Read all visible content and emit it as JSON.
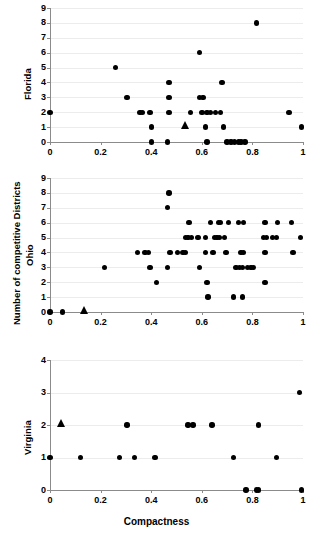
{
  "figure": {
    "background": "#ffffff",
    "marker_color": "#000000",
    "gridline_color": "#ececed",
    "axis_color": "#8b8b8b",
    "xlabel": "Compactness",
    "ylabel": "Number of competitive Districts"
  },
  "chart_data": {
    "type": "scatter",
    "title": "",
    "xlabel": "Compactness",
    "ylabel": "Number of competitive Districts",
    "xlim": [
      0,
      1
    ],
    "xticks": [
      0,
      0.2,
      0.4,
      0.6,
      0.8,
      1
    ],
    "xticklabels": [
      "0",
      "0.2",
      "0.4",
      "0.6",
      "0.8",
      "1"
    ],
    "grid": true,
    "legend": null,
    "panels": [
      {
        "name": "Florida",
        "label": "Florida",
        "ylim": [
          0,
          9
        ],
        "yticks": [
          0,
          1,
          2,
          3,
          4,
          5,
          6,
          7,
          8,
          9
        ],
        "yticklabels": [
          "0",
          "1",
          "2",
          "3",
          "4",
          "5",
          "6",
          "7",
          "8",
          "9"
        ],
        "series": [
          {
            "name": "districts",
            "marker": "circle",
            "points": [
              [
                0.0,
                2
              ],
              [
                0.26,
                5
              ],
              [
                0.305,
                3
              ],
              [
                0.355,
                2
              ],
              [
                0.365,
                2
              ],
              [
                0.395,
                2
              ],
              [
                0.4,
                1
              ],
              [
                0.4,
                0
              ],
              [
                0.465,
                0
              ],
              [
                0.47,
                4
              ],
              [
                0.47,
                3
              ],
              [
                0.47,
                2
              ],
              [
                0.555,
                2
              ],
              [
                0.59,
                6
              ],
              [
                0.59,
                3
              ],
              [
                0.605,
                3
              ],
              [
                0.6,
                2
              ],
              [
                0.615,
                1
              ],
              [
                0.62,
                2
              ],
              [
                0.635,
                2
              ],
              [
                0.62,
                0
              ],
              [
                0.655,
                2
              ],
              [
                0.675,
                2
              ],
              [
                0.68,
                4
              ],
              [
                0.685,
                1
              ],
              [
                0.7,
                0
              ],
              [
                0.715,
                0
              ],
              [
                0.73,
                0
              ],
              [
                0.745,
                0
              ],
              [
                0.755,
                0
              ],
              [
                0.77,
                0
              ],
              [
                0.815,
                8
              ],
              [
                0.945,
                2
              ],
              [
                0.995,
                1
              ]
            ]
          },
          {
            "name": "state-mean",
            "marker": "triangle",
            "points": [
              [
                0.535,
                1
              ]
            ]
          }
        ]
      },
      {
        "name": "Ohio",
        "label": "Ohio",
        "ylim": [
          0,
          9
        ],
        "yticks": [
          0,
          1,
          2,
          3,
          4,
          5,
          6,
          7,
          8,
          9
        ],
        "yticklabels": [
          "0",
          "1",
          "2",
          "3",
          "4",
          "5",
          "6",
          "7",
          "8",
          "9"
        ],
        "series": [
          {
            "name": "districts",
            "marker": "circle",
            "points": [
              [
                0.0,
                0
              ],
              [
                0.05,
                0
              ],
              [
                0.215,
                3
              ],
              [
                0.345,
                4
              ],
              [
                0.375,
                4
              ],
              [
                0.39,
                4
              ],
              [
                0.395,
                3
              ],
              [
                0.42,
                2
              ],
              [
                0.47,
                8
              ],
              [
                0.465,
                7
              ],
              [
                0.465,
                3
              ],
              [
                0.475,
                4
              ],
              [
                0.505,
                4
              ],
              [
                0.525,
                4
              ],
              [
                0.535,
                4
              ],
              [
                0.535,
                5
              ],
              [
                0.545,
                5
              ],
              [
                0.55,
                6
              ],
              [
                0.56,
                5
              ],
              [
                0.585,
                5
              ],
              [
                0.59,
                3
              ],
              [
                0.615,
                5
              ],
              [
                0.615,
                4
              ],
              [
                0.62,
                2
              ],
              [
                0.625,
                1
              ],
              [
                0.635,
                6
              ],
              [
                0.645,
                4
              ],
              [
                0.65,
                5
              ],
              [
                0.66,
                5
              ],
              [
                0.665,
                6
              ],
              [
                0.67,
                5
              ],
              [
                0.675,
                6
              ],
              [
                0.69,
                5
              ],
              [
                0.695,
                4
              ],
              [
                0.705,
                6
              ],
              [
                0.725,
                1
              ],
              [
                0.735,
                3
              ],
              [
                0.745,
                6
              ],
              [
                0.75,
                3
              ],
              [
                0.755,
                4
              ],
              [
                0.76,
                1
              ],
              [
                0.76,
                3
              ],
              [
                0.765,
                4
              ],
              [
                0.765,
                6
              ],
              [
                0.78,
                3
              ],
              [
                0.795,
                3
              ],
              [
                0.805,
                3
              ],
              [
                0.85,
                6
              ],
              [
                0.85,
                2
              ],
              [
                0.845,
                5
              ],
              [
                0.855,
                5
              ],
              [
                0.85,
                4
              ],
              [
                0.88,
                5
              ],
              [
                0.895,
                5
              ],
              [
                0.9,
                6
              ],
              [
                0.955,
                6
              ],
              [
                0.96,
                4
              ],
              [
                0.99,
                5
              ]
            ]
          },
          {
            "name": "state-mean",
            "marker": "triangle",
            "points": [
              [
                0.135,
                0
              ]
            ]
          }
        ]
      },
      {
        "name": "Virginia",
        "label": "Virginia",
        "ylim": [
          0,
          4
        ],
        "yticks": [
          0,
          1,
          2,
          3,
          4
        ],
        "yticklabels": [
          "0",
          "1",
          "2",
          "3",
          "4"
        ],
        "series": [
          {
            "name": "districts",
            "marker": "circle",
            "points": [
              [
                0.0,
                1
              ],
              [
                0.12,
                1
              ],
              [
                0.275,
                1
              ],
              [
                0.305,
                2
              ],
              [
                0.335,
                1
              ],
              [
                0.415,
                1
              ],
              [
                0.545,
                2
              ],
              [
                0.565,
                2
              ],
              [
                0.64,
                2
              ],
              [
                0.725,
                1
              ],
              [
                0.775,
                0
              ],
              [
                0.815,
                0
              ],
              [
                0.825,
                0
              ],
              [
                0.825,
                2
              ],
              [
                0.895,
                1
              ],
              [
                0.985,
                3
              ],
              [
                0.995,
                0
              ]
            ]
          },
          {
            "name": "state-mean",
            "marker": "triangle",
            "points": [
              [
                0.045,
                2
              ]
            ]
          }
        ]
      }
    ]
  }
}
